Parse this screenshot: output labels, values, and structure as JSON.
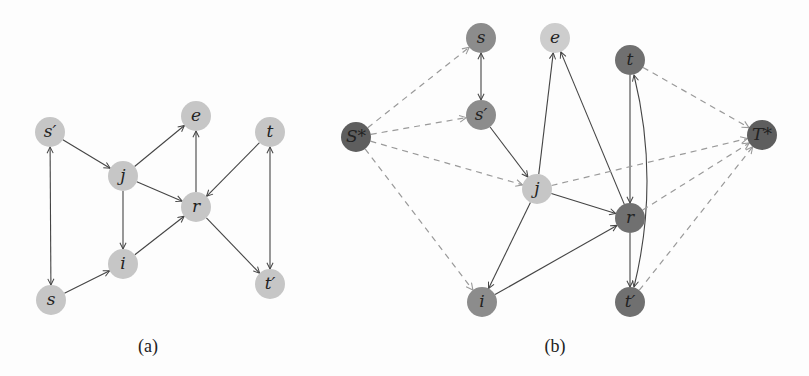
{
  "figure": {
    "panels": [
      {
        "id": "a",
        "caption": "(a)",
        "caption_pos": [
          148,
          352
        ],
        "nodes": [
          {
            "id": "s_prime",
            "label": "s′",
            "x": 50,
            "y": 132,
            "color": "#c6c6c6"
          },
          {
            "id": "e",
            "label": "e",
            "x": 196,
            "y": 116,
            "color": "#c6c6c6"
          },
          {
            "id": "t",
            "label": "t",
            "x": 270,
            "y": 132,
            "color": "#c6c6c6"
          },
          {
            "id": "j",
            "label": "j",
            "x": 123,
            "y": 176,
            "color": "#c6c6c6"
          },
          {
            "id": "r",
            "label": "r",
            "x": 196,
            "y": 207,
            "color": "#c6c6c6"
          },
          {
            "id": "i",
            "label": "i",
            "x": 123,
            "y": 264,
            "color": "#c6c6c6"
          },
          {
            "id": "s",
            "label": "s",
            "x": 51,
            "y": 300,
            "color": "#c6c6c6"
          },
          {
            "id": "t_prime",
            "label": "t′",
            "x": 270,
            "y": 284,
            "color": "#c6c6c6"
          }
        ],
        "edges": [
          {
            "from": "s_prime",
            "to": "j",
            "style": "solid",
            "bidir": false
          },
          {
            "from": "j",
            "to": "e",
            "style": "solid",
            "bidir": false
          },
          {
            "from": "j",
            "to": "r",
            "style": "solid",
            "bidir": false
          },
          {
            "from": "j",
            "to": "i",
            "style": "solid",
            "bidir": false
          },
          {
            "from": "r",
            "to": "e",
            "style": "solid",
            "bidir": false
          },
          {
            "from": "t",
            "to": "r",
            "style": "solid",
            "bidir": false
          },
          {
            "from": "i",
            "to": "r",
            "style": "solid",
            "bidir": false
          },
          {
            "from": "s",
            "to": "i",
            "style": "solid",
            "bidir": false
          },
          {
            "from": "r",
            "to": "t_prime",
            "style": "solid",
            "bidir": false
          },
          {
            "from": "s_prime",
            "to": "s",
            "style": "solid",
            "bidir": true
          },
          {
            "from": "t",
            "to": "t_prime",
            "style": "solid",
            "bidir": true
          }
        ]
      },
      {
        "id": "b",
        "caption": "(b)",
        "caption_pos": [
          555,
          352
        ],
        "nodes": [
          {
            "id": "s",
            "label": "s",
            "x": 481,
            "y": 38,
            "color": "#8c8c8c"
          },
          {
            "id": "e",
            "label": "e",
            "x": 555,
            "y": 38,
            "color": "#cdcdcd"
          },
          {
            "id": "t",
            "label": "t",
            "x": 630,
            "y": 60,
            "color": "#707070"
          },
          {
            "id": "S_star",
            "label": "S*",
            "x": 356,
            "y": 137,
            "color": "#5e5e5e"
          },
          {
            "id": "s_prime",
            "label": "s′",
            "x": 481,
            "y": 115,
            "color": "#8c8c8c"
          },
          {
            "id": "T_star",
            "label": "T*",
            "x": 762,
            "y": 135,
            "color": "#5e5e5e"
          },
          {
            "id": "j",
            "label": "j",
            "x": 537,
            "y": 189,
            "color": "#c6c6c6"
          },
          {
            "id": "r",
            "label": "r",
            "x": 630,
            "y": 218,
            "color": "#707070"
          },
          {
            "id": "i",
            "label": "i",
            "x": 482,
            "y": 302,
            "color": "#8c8c8c"
          },
          {
            "id": "t_prime",
            "label": "t′",
            "x": 630,
            "y": 302,
            "color": "#707070"
          }
        ],
        "edges": [
          {
            "from": "s",
            "to": "s_prime",
            "style": "solid",
            "bidir": true
          },
          {
            "from": "s_prime",
            "to": "j",
            "style": "solid",
            "bidir": false
          },
          {
            "from": "j",
            "to": "e",
            "style": "solid",
            "bidir": false
          },
          {
            "from": "r",
            "to": "e",
            "style": "solid",
            "bidir": false
          },
          {
            "from": "j",
            "to": "r",
            "style": "solid",
            "bidir": false
          },
          {
            "from": "j",
            "to": "i",
            "style": "solid",
            "bidir": false
          },
          {
            "from": "i",
            "to": "r",
            "style": "solid",
            "bidir": false
          },
          {
            "from": "t",
            "to": "r",
            "style": "solid",
            "bidir": false
          },
          {
            "from": "r",
            "to": "t_prime",
            "style": "solid",
            "bidir": false
          },
          {
            "from": "t",
            "to": "t_prime",
            "style": "solid",
            "bidir": true,
            "curve": 30
          },
          {
            "from": "S_star",
            "to": "s",
            "style": "dashed",
            "bidir": false
          },
          {
            "from": "S_star",
            "to": "s_prime",
            "style": "dashed",
            "bidir": false
          },
          {
            "from": "S_star",
            "to": "j",
            "style": "dashed",
            "bidir": false
          },
          {
            "from": "S_star",
            "to": "i",
            "style": "dashed",
            "bidir": false
          },
          {
            "from": "t",
            "to": "T_star",
            "style": "dashed",
            "bidir": false
          },
          {
            "from": "j",
            "to": "T_star",
            "style": "dashed",
            "bidir": false
          },
          {
            "from": "r",
            "to": "T_star",
            "style": "dashed",
            "bidir": false
          },
          {
            "from": "t_prime",
            "to": "T_star",
            "style": "dashed",
            "bidir": false
          }
        ]
      }
    ],
    "colors": {
      "edge_solid": "#444444",
      "edge_dashed": "#9a9a9a",
      "background": "#fdfdfd"
    },
    "node_radius": 15
  }
}
